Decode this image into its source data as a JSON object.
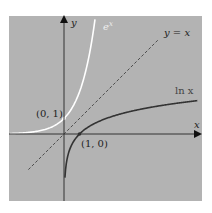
{
  "chart_data": {
    "type": "line",
    "title": "",
    "xlabel": "x",
    "ylabel": "y",
    "series": [
      {
        "name": "e^x",
        "function": "exp(x)",
        "color": "#ffffff"
      },
      {
        "name": "ln x",
        "function": "log(x)",
        "color": "#333333"
      },
      {
        "name": "y = x",
        "function": "x",
        "color": "#333333",
        "style": "dashed"
      }
    ],
    "points": [
      {
        "label": "(0, 1)",
        "x": 0,
        "y": 1
      },
      {
        "label": "(1, 0)",
        "x": 1,
        "y": 0
      }
    ],
    "xlim": [
      -3.5,
      8.8
    ],
    "ylim": [
      -4.3,
      7.5
    ],
    "grid": false,
    "background": "#b3b3b3"
  },
  "labels": {
    "y_axis": "y",
    "x_axis": "x",
    "exp": "e",
    "exp_sup": "x",
    "identity": "y = x",
    "ln": "ln x",
    "point_01": "(0, 1)",
    "point_10": "(1, 0)"
  }
}
